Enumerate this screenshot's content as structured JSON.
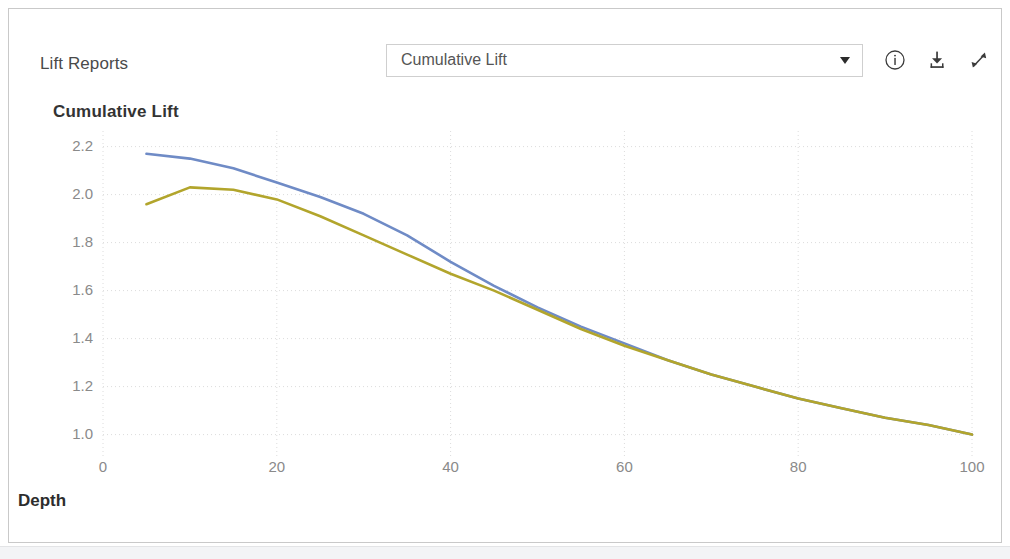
{
  "panel": {
    "title": "Lift Reports"
  },
  "report_select": {
    "value": "Cumulative Lift",
    "options": [
      "Cumulative Lift",
      "Lift",
      "Gains",
      "Cumulative Gains",
      "Response",
      "Cumulative Response"
    ],
    "caret_icon": "chevron-down-icon"
  },
  "actions": [
    {
      "name": "info-icon",
      "label": "Info"
    },
    {
      "name": "download-icon",
      "label": "Download"
    },
    {
      "name": "expand-icon",
      "label": "Expand"
    }
  ],
  "colors": {
    "series_1": "#6f8bc6",
    "series_2": "#b2a52c",
    "grid": "#dcdcdc",
    "axis_text": "#8a8a8a",
    "card_border": "#c9c9c9"
  },
  "chart_data": {
    "type": "line",
    "title": "Cumulative Lift",
    "xlabel": "Depth",
    "ylabel": "",
    "xlim": [
      0,
      100
    ],
    "ylim": [
      0.94,
      2.24
    ],
    "xticks": [
      0,
      20,
      40,
      60,
      80,
      100
    ],
    "yticks": [
      1.0,
      1.2,
      1.4,
      1.6,
      1.8,
      2.0,
      2.2
    ],
    "grid": true,
    "legend": "none",
    "series": [
      {
        "name": "Series 1",
        "color": "#6f8bc6",
        "x": [
          5,
          10,
          15,
          20,
          25,
          30,
          35,
          40,
          45,
          50,
          55,
          60,
          65,
          70,
          75,
          80,
          85,
          90,
          95,
          100
        ],
        "values": [
          2.17,
          2.15,
          2.11,
          2.05,
          1.99,
          1.92,
          1.83,
          1.72,
          1.62,
          1.53,
          1.45,
          1.38,
          1.31,
          1.25,
          1.2,
          1.15,
          1.11,
          1.07,
          1.04,
          1.0
        ]
      },
      {
        "name": "Series 2",
        "color": "#b2a52c",
        "x": [
          5,
          10,
          15,
          20,
          25,
          30,
          35,
          40,
          45,
          50,
          55,
          60,
          65,
          70,
          75,
          80,
          85,
          90,
          95,
          100
        ],
        "values": [
          1.96,
          2.03,
          2.02,
          1.98,
          1.91,
          1.83,
          1.75,
          1.67,
          1.6,
          1.52,
          1.44,
          1.37,
          1.31,
          1.25,
          1.2,
          1.15,
          1.11,
          1.07,
          1.04,
          1.0
        ]
      }
    ]
  }
}
